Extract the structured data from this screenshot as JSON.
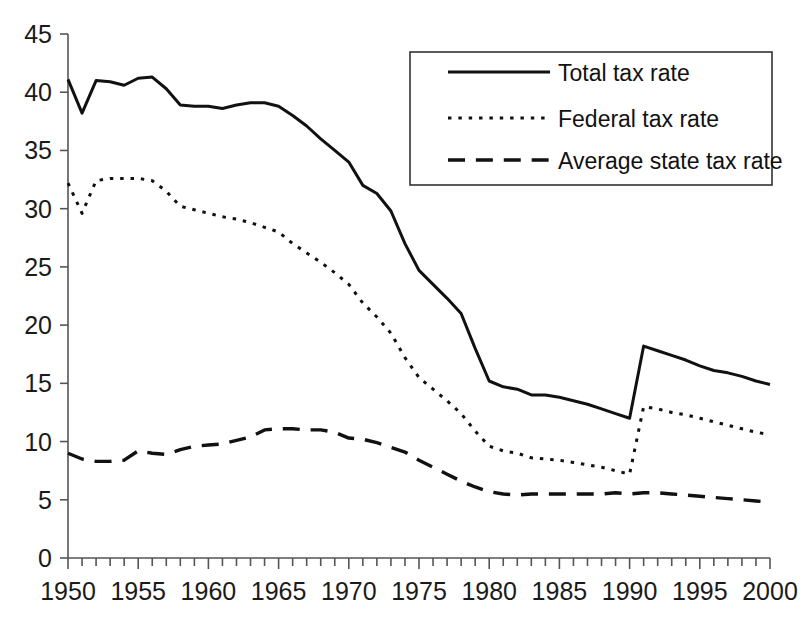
{
  "chart_data": {
    "type": "line",
    "title": "",
    "xlabel": "",
    "ylabel": "",
    "xlim": [
      1950,
      2000
    ],
    "ylim": [
      0,
      45
    ],
    "ytick_step": 5,
    "xtick_step": 1,
    "xtick_label_step": 5,
    "grid": false,
    "legend_position": "top-right",
    "ytick_labels": [
      "0",
      "5",
      "10",
      "15",
      "20",
      "25",
      "30",
      "35",
      "40",
      "45"
    ],
    "ytick_values": [
      0,
      5,
      10,
      15,
      20,
      25,
      30,
      35,
      40,
      45
    ],
    "xtick_labels": [
      "1950",
      "1955",
      "1960",
      "1965",
      "1970",
      "1975",
      "1980",
      "1985",
      "1990",
      "1995",
      "2000"
    ],
    "xtick_values": [
      1950,
      1955,
      1960,
      1965,
      1970,
      1975,
      1980,
      1985,
      1990,
      1995,
      2000
    ],
    "x": [
      1950,
      1951,
      1952,
      1953,
      1954,
      1955,
      1956,
      1957,
      1958,
      1959,
      1960,
      1961,
      1962,
      1963,
      1964,
      1965,
      1966,
      1967,
      1968,
      1969,
      1970,
      1971,
      1972,
      1973,
      1974,
      1975,
      1976,
      1977,
      1978,
      1979,
      1980,
      1981,
      1982,
      1983,
      1984,
      1985,
      1986,
      1987,
      1988,
      1989,
      1990,
      1991,
      1992,
      1993,
      1994,
      1995,
      1996,
      1997,
      1998,
      1999,
      2000
    ],
    "series": [
      {
        "name": "Total tax rate",
        "style": "solid",
        "color": "#111111",
        "line_width": 3.0,
        "values": [
          41.1,
          38.2,
          41.0,
          40.9,
          40.6,
          41.2,
          41.3,
          40.3,
          38.9,
          38.8,
          38.8,
          38.6,
          38.9,
          39.1,
          39.1,
          38.8,
          38.0,
          37.1,
          36.0,
          35.0,
          34.0,
          32.0,
          31.3,
          29.8,
          27.0,
          24.7,
          23.5,
          22.3,
          21.0,
          18.0,
          15.2,
          14.7,
          14.5,
          14.0,
          14.0,
          13.8,
          13.5,
          13.2,
          12.8,
          12.4,
          12.0,
          18.2,
          17.8,
          17.4,
          17.0,
          16.5,
          16.1,
          15.9,
          15.6,
          15.2,
          14.9
        ]
      },
      {
        "name": "Federal tax rate",
        "style": "dotted",
        "color": "#111111",
        "line_width": 3.0,
        "values": [
          32.2,
          29.6,
          32.4,
          32.6,
          32.6,
          32.6,
          32.4,
          31.5,
          30.2,
          29.9,
          29.6,
          29.3,
          29.1,
          28.8,
          28.4,
          28.0,
          27.0,
          26.2,
          25.4,
          24.5,
          23.5,
          21.9,
          20.7,
          19.3,
          17.2,
          15.5,
          14.5,
          13.5,
          12.4,
          10.9,
          9.6,
          9.2,
          9.0,
          8.6,
          8.5,
          8.4,
          8.2,
          8.0,
          7.8,
          7.5,
          7.2,
          13.0,
          12.8,
          12.5,
          12.3,
          12.0,
          11.7,
          11.4,
          11.1,
          10.8,
          10.6
        ]
      },
      {
        "name": "Average state tax rate",
        "style": "dashed",
        "color": "#111111",
        "line_width": 3.4,
        "values": [
          9.0,
          8.5,
          8.3,
          8.3,
          8.4,
          9.2,
          9.0,
          8.9,
          9.3,
          9.6,
          9.7,
          9.8,
          10.1,
          10.4,
          11.0,
          11.1,
          11.1,
          11.0,
          11.0,
          10.8,
          10.3,
          10.2,
          9.9,
          9.5,
          9.1,
          8.4,
          7.8,
          7.2,
          6.6,
          6.1,
          5.7,
          5.5,
          5.4,
          5.5,
          5.5,
          5.5,
          5.5,
          5.5,
          5.5,
          5.6,
          5.5,
          5.6,
          5.6,
          5.5,
          5.4,
          5.3,
          5.2,
          5.1,
          5.0,
          4.9,
          4.8
        ]
      }
    ]
  },
  "legend": {
    "entries": [
      {
        "label": "Total tax rate",
        "style": "solid"
      },
      {
        "label": "Federal tax rate",
        "style": "dotted"
      },
      {
        "label": "Average state tax rate",
        "style": "dashed"
      }
    ]
  }
}
